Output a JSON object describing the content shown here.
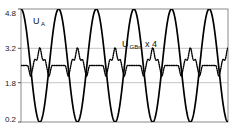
{
  "chart_data": {
    "type": "line",
    "title": "",
    "xlabel": "",
    "ylabel": "",
    "ylim": [
      0.2,
      4.8
    ],
    "xlim": [
      0,
      5.5
    ],
    "grid": true,
    "grid_lines": [
      3.2,
      1.8
    ],
    "yticks": [
      4.8,
      3.2,
      1.8,
      0.2
    ],
    "ytick_labels": [
      "4.8",
      "3.2",
      "1.8",
      "0.2"
    ],
    "xticks": [],
    "xtick_labels": [],
    "legend": "inline-annotations",
    "series": [
      {
        "name": "U_A",
        "label_main": "U",
        "label_sub": "A",
        "style": "solid",
        "color": "#000000",
        "amplitude": 2.3,
        "offset": 2.5,
        "periods": 5.5,
        "phase": 0.0,
        "description": "Large solid sinusoid swinging between 0.2 and 4.8"
      },
      {
        "name": "U_GBn x 4",
        "label_main": "U",
        "label_sub": "GBn",
        "label_suffix": " x 4",
        "style": "dotted",
        "color": "#000000",
        "amplitude": 0.72,
        "offset": 2.5,
        "periods": 5.5,
        "phase": 0.0,
        "description": "Small dotted periodic waveform with flat plateau, dip, double hump crest, dip"
      }
    ]
  },
  "axes": {
    "frame_color": "#8a8a8a",
    "grid_color": "#b5b5b5",
    "tick_color": "#555555"
  },
  "annotations": {
    "ua": {
      "main": "U",
      "sub": "A"
    },
    "ugbn": {
      "main": "U",
      "sub": "GBn",
      "suffix": "x 4"
    }
  }
}
